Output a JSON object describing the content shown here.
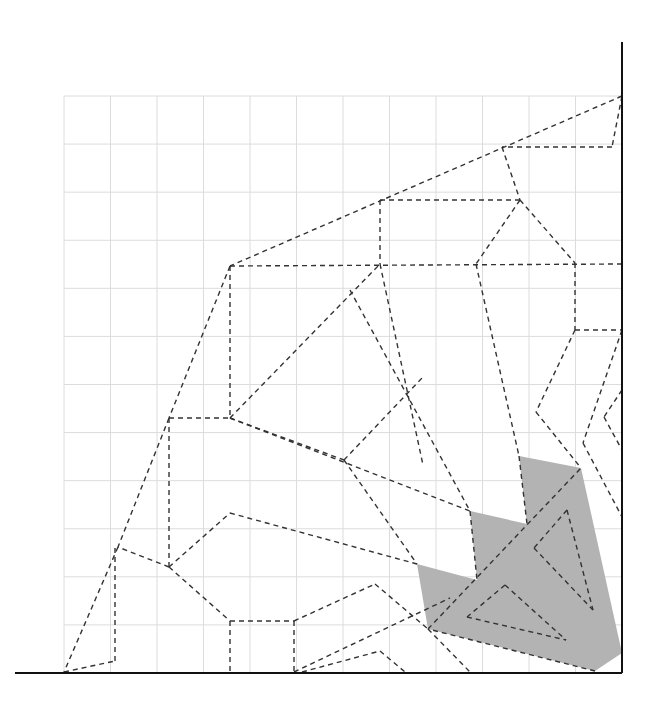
{
  "diagram": {
    "type": "crease-pattern",
    "colors": {
      "background": "#ffffff",
      "grid": "#dcdcdc",
      "crease": "#333333",
      "border": "#111111",
      "shaded": "#b3b3b3"
    },
    "grid": {
      "x0": 64,
      "y0": 96,
      "cell": 48,
      "cols": 12,
      "rows": 12
    },
    "borders": [
      {
        "name": "right-edge",
        "x1": 622,
        "y1": 42,
        "x2": 622,
        "y2": 673
      },
      {
        "name": "bottom-edge",
        "x1": 15,
        "y1": 673,
        "x2": 622,
        "y2": 673
      }
    ],
    "shaded_region": [
      [
        519,
        456
      ],
      [
        581,
        468
      ],
      [
        622,
        653
      ],
      [
        595,
        671
      ],
      [
        428,
        629
      ],
      [
        417,
        564
      ],
      [
        477,
        580
      ],
      [
        470,
        511
      ],
      [
        527,
        524
      ]
    ],
    "creases": [
      [
        622,
        96,
        230,
        266
      ],
      [
        622,
        96,
        612,
        147
      ],
      [
        612,
        147,
        502,
        147
      ],
      [
        502,
        147,
        520,
        200
      ],
      [
        380,
        200,
        520,
        200
      ],
      [
        380,
        200,
        380,
        264
      ],
      [
        230,
        266,
        622,
        264
      ],
      [
        230,
        266,
        230,
        416
      ],
      [
        230,
        266,
        169,
        418
      ],
      [
        169,
        418,
        230,
        418
      ],
      [
        230,
        418,
        380,
        264
      ],
      [
        380,
        264,
        423,
        465
      ],
      [
        350,
        290,
        470,
        511
      ],
      [
        520,
        200,
        476,
        264
      ],
      [
        520,
        200,
        575,
        263
      ],
      [
        476,
        264,
        519,
        456
      ],
      [
        575,
        263,
        575,
        330
      ],
      [
        575,
        330,
        622,
        330
      ],
      [
        575,
        330,
        536,
        412
      ],
      [
        536,
        412,
        581,
        468
      ],
      [
        622,
        330,
        583,
        443
      ],
      [
        230,
        418,
        470,
        511
      ],
      [
        230,
        418,
        344,
        460
      ],
      [
        344,
        460,
        417,
        564
      ],
      [
        344,
        460,
        422,
        378
      ],
      [
        169,
        418,
        118,
        547
      ],
      [
        118,
        547,
        64,
        672
      ],
      [
        169,
        418,
        169,
        567
      ],
      [
        169,
        567,
        118,
        547
      ],
      [
        169,
        567,
        230,
        513
      ],
      [
        230,
        513,
        417,
        564
      ],
      [
        169,
        567,
        230,
        621
      ],
      [
        230,
        621,
        230,
        672
      ],
      [
        230,
        621,
        294,
        621
      ],
      [
        294,
        621,
        294,
        672
      ],
      [
        294,
        621,
        375,
        584
      ],
      [
        375,
        584,
        428,
        629
      ],
      [
        294,
        672,
        450,
        598
      ],
      [
        302,
        672,
        380,
        651
      ],
      [
        380,
        651,
        405,
        672
      ],
      [
        428,
        629,
        470,
        672
      ],
      [
        64,
        672,
        115,
        661
      ],
      [
        115,
        661,
        115,
        547
      ],
      [
        622,
        390,
        604,
        417
      ],
      [
        604,
        417,
        622,
        450
      ],
      [
        583,
        443,
        622,
        517
      ],
      [
        519,
        456,
        527,
        524
      ],
      [
        428,
        629,
        581,
        468
      ],
      [
        470,
        511,
        477,
        580
      ],
      [
        567,
        510,
        593,
        610
      ],
      [
        567,
        510,
        534,
        548
      ],
      [
        534,
        548,
        593,
        610
      ],
      [
        505,
        585,
        467,
        617
      ],
      [
        467,
        617,
        566,
        640
      ],
      [
        505,
        585,
        566,
        640
      ],
      [
        595,
        671,
        428,
        629
      ]
    ]
  }
}
